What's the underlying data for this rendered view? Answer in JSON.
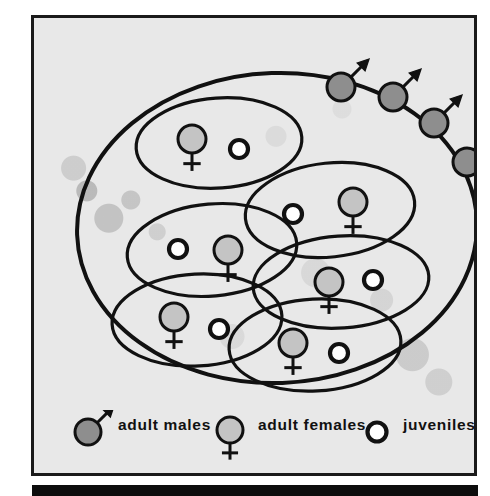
{
  "figure": {
    "background_color": "#e8e8e8",
    "frame_color": "#1a1a1a",
    "male_fill": "#8e8e8e",
    "female_fill": "#c4c4c4",
    "juvenile_fill": "#ffffff",
    "outline_color": "#111111"
  },
  "outer_group": {
    "name": "outer-population-oval",
    "cx": 243,
    "cy": 210,
    "rx": 200,
    "ry": 155,
    "rotation": -2
  },
  "subgroups": [
    {
      "id": "subgroup-1",
      "cx": 185,
      "cy": 125,
      "rx": 83,
      "ry": 45,
      "rotation": -4,
      "members": [
        {
          "type": "adult-female",
          "dx": -27,
          "dy": -4
        },
        {
          "type": "juvenile",
          "dx": 20,
          "dy": 6
        }
      ]
    },
    {
      "id": "subgroup-2",
      "cx": 296,
      "cy": 192,
      "rx": 85,
      "ry": 47,
      "rotation": -6,
      "members": [
        {
          "type": "juvenile",
          "dx": -37,
          "dy": 4
        },
        {
          "type": "adult-female",
          "dx": 23,
          "dy": -8
        }
      ]
    },
    {
      "id": "subgroup-3",
      "cx": 178,
      "cy": 232,
      "rx": 85,
      "ry": 46,
      "rotation": -5,
      "members": [
        {
          "type": "juvenile",
          "dx": -34,
          "dy": -1
        },
        {
          "type": "adult-female",
          "dx": 16,
          "dy": 0
        }
      ]
    },
    {
      "id": "subgroup-4",
      "cx": 307,
      "cy": 264,
      "rx": 88,
      "ry": 46,
      "rotation": -4,
      "members": [
        {
          "type": "adult-female",
          "dx": -12,
          "dy": 0
        },
        {
          "type": "juvenile",
          "dx": 32,
          "dy": -2
        }
      ]
    },
    {
      "id": "subgroup-5",
      "cx": 163,
      "cy": 302,
      "rx": 85,
      "ry": 46,
      "rotation": -3,
      "members": [
        {
          "type": "adult-female",
          "dx": -23,
          "dy": -3
        },
        {
          "type": "juvenile",
          "dx": 22,
          "dy": 9
        }
      ]
    },
    {
      "id": "subgroup-6",
      "cx": 281,
      "cy": 327,
      "rx": 86,
      "ry": 46,
      "rotation": -3,
      "members": [
        {
          "type": "adult-female",
          "dx": -22,
          "dy": -2
        },
        {
          "type": "juvenile",
          "dx": 24,
          "dy": 8
        }
      ]
    }
  ],
  "outside_males": [
    {
      "id": "male-1",
      "cx": 307,
      "cy": 69
    },
    {
      "id": "male-2",
      "cx": 359,
      "cy": 79
    },
    {
      "id": "male-3",
      "cx": 400,
      "cy": 105
    },
    {
      "id": "male-4",
      "cx": 433,
      "cy": 144
    }
  ],
  "legend": {
    "items": [
      {
        "id": "legend-adult-males",
        "symbol": "adult-male-symbol",
        "label": "adult males",
        "symbol_x": 54,
        "label_x": 84
      },
      {
        "id": "legend-adult-females",
        "symbol": "adult-female-symbol",
        "label": "adult females",
        "symbol_x": 196,
        "label_x": 224
      },
      {
        "id": "legend-juveniles",
        "symbol": "juvenile-symbol",
        "label": "juveniles",
        "symbol_x": 343,
        "label_x": 369
      }
    ]
  },
  "bottom_bar": {
    "name": "bottom-rule",
    "color": "#0d0d0d"
  }
}
